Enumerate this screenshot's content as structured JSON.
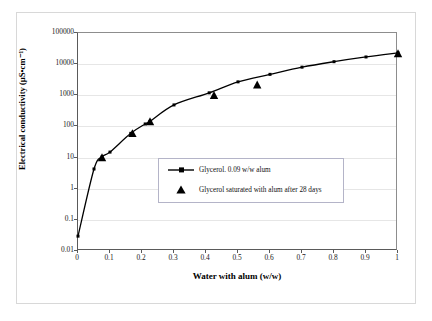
{
  "figure": {
    "background_color": "#ffffff",
    "frame_color": "#d8d8d8",
    "line_color": "#000000",
    "axis_color": "#5a5a5a",
    "grid_color": "#e6e6e6"
  },
  "chart_data": {
    "type": "line",
    "title": "",
    "xlabel": "Water with alum (w/w)",
    "ylabel": "Electrical conductivity (µS•cm⁻¹)",
    "xlim": [
      0,
      1
    ],
    "ylim": [
      0.01,
      100000
    ],
    "yscale": "log",
    "xscale": "linear",
    "grid": true,
    "legend_position": "center",
    "xticks": [
      "0",
      "0.1",
      "0.2",
      "0.3",
      "0.4",
      "0.5",
      "0.6",
      "0.7",
      "0.8",
      "0.9",
      "1"
    ],
    "xtick_values": [
      0,
      0.1,
      0.2,
      0.3,
      0.4,
      0.5,
      0.6,
      0.7,
      0.8,
      0.9,
      1
    ],
    "yticks": [
      "0.01",
      "0.1",
      "1",
      "10",
      "100",
      "1000",
      "10000",
      "100000"
    ],
    "ytick_values": [
      0.01,
      0.1,
      1,
      10,
      100,
      1000,
      10000,
      100000
    ],
    "series": [
      {
        "name": "Glycerol. 0.09 w/w alum",
        "marker": "line-with-dots",
        "color": "#000000",
        "points": [
          {
            "x": 0.0,
            "y": 0.03
          },
          {
            "x": 0.05,
            "y": 4.3
          },
          {
            "x": 0.075,
            "y": 10.5
          },
          {
            "x": 0.1,
            "y": 15.0
          },
          {
            "x": 0.165,
            "y": 60.0
          },
          {
            "x": 0.21,
            "y": 120.0
          },
          {
            "x": 0.225,
            "y": 145.0
          },
          {
            "x": 0.3,
            "y": 490.0
          },
          {
            "x": 0.41,
            "y": 1200.0
          },
          {
            "x": 0.5,
            "y": 2700.0
          },
          {
            "x": 0.6,
            "y": 4700.0
          },
          {
            "x": 0.7,
            "y": 8000.0
          },
          {
            "x": 0.8,
            "y": 12000.0
          },
          {
            "x": 0.9,
            "y": 17000.0
          },
          {
            "x": 1.0,
            "y": 23000.0
          }
        ]
      },
      {
        "name": "Glycerol saturated with alum after 28 days",
        "marker": "triangle",
        "color": "#000000",
        "points": [
          {
            "x": 0.075,
            "y": 10.0
          },
          {
            "x": 0.17,
            "y": 60.0
          },
          {
            "x": 0.225,
            "y": 145.0
          },
          {
            "x": 0.425,
            "y": 1000.0
          },
          {
            "x": 0.56,
            "y": 2200.0
          },
          {
            "x": 1.0,
            "y": 22000.0
          }
        ]
      }
    ],
    "legend_entries": [
      {
        "label": "Glycerol. 0.09 w/w alum",
        "symbol": "line-with-dots"
      },
      {
        "label": "Glycerol saturated with alum after 28 days",
        "symbol": "triangle"
      }
    ]
  }
}
